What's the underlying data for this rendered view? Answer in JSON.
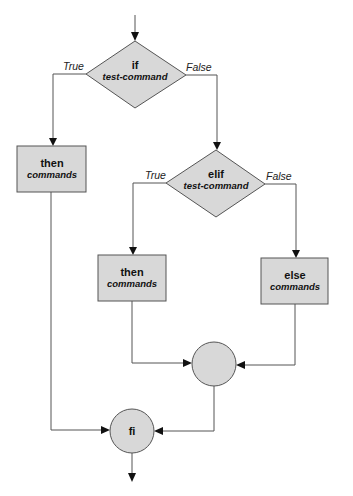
{
  "diagram": {
    "type": "flowchart",
    "colors": {
      "node_fill": "#d8d8d8",
      "stroke": "#555555",
      "arrowhead": "#111111",
      "text": "#111111"
    },
    "nodes": {
      "if_decision": {
        "keyword": "if",
        "text": "test-command"
      },
      "then_box_1": {
        "keyword": "then",
        "text": "commands"
      },
      "elif_decision": {
        "keyword": "elif",
        "text": "test-command"
      },
      "then_box_2": {
        "keyword": "then",
        "text": "commands"
      },
      "else_box": {
        "keyword": "else",
        "text": "commands"
      },
      "merge_circle": {
        "keyword": ""
      },
      "fi_circle": {
        "keyword": "fi"
      }
    },
    "edge_labels": {
      "if_true": "True",
      "if_false": "False",
      "elif_true": "True",
      "elif_false": "False"
    }
  }
}
